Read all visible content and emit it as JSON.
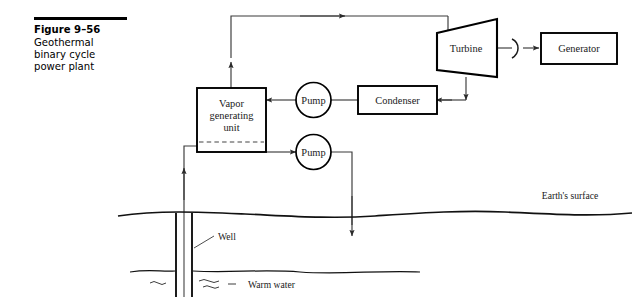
{
  "figure": {
    "number": "Figure 9–56",
    "caption_lines": [
      "Geothermal",
      "binary cycle",
      "power plant"
    ]
  },
  "diagram": {
    "title": "Geothermal binary cycle power plant",
    "components": {
      "vapor_generating_unit": {
        "label_line1": "Vapor",
        "label_line2": "generating",
        "label_line3": "unit"
      },
      "pump_upper": {
        "label": "Pump"
      },
      "pump_lower": {
        "label": "Pump"
      },
      "condenser": {
        "label": "Condenser"
      },
      "turbine": {
        "label": "Turbine"
      },
      "generator": {
        "label": "Generator"
      }
    },
    "annotations": {
      "earth_surface": "Earth's surface",
      "well": "Well",
      "warm_water": "Warm water"
    },
    "colors": {
      "outline": "#000000",
      "pipe": "#3a3a3a",
      "text": "#1a1a1a",
      "background": "#ffffff"
    }
  }
}
